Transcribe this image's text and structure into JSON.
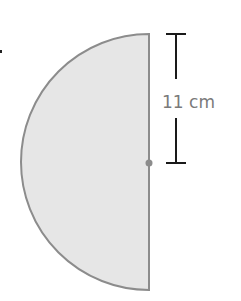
{
  "diagram": {
    "shape": "semicircle",
    "radius_label": "11 cm",
    "fill_color": "#e6e6e6",
    "stroke_color": "#8c8c8c",
    "dimension_color": "#1a1a1a",
    "center_dot_color": "#8c8c8c"
  }
}
